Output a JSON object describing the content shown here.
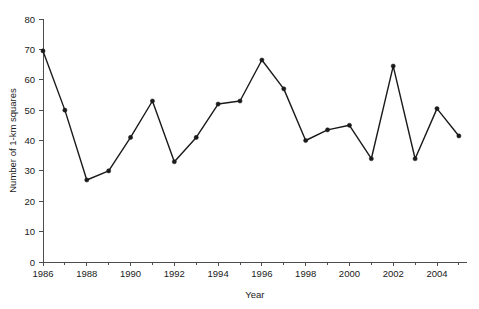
{
  "chart_data": {
    "type": "line",
    "title": "",
    "xlabel": "Year",
    "ylabel": "Number of 1-km squares",
    "x": [
      1986,
      1987,
      1988,
      1989,
      1990,
      1991,
      1992,
      1993,
      1994,
      1995,
      1996,
      1997,
      1998,
      1999,
      2000,
      2001,
      2002,
      2003,
      2004,
      2005
    ],
    "values": [
      69.5,
      50,
      27,
      30,
      41,
      53,
      33,
      41,
      52,
      53,
      66.5,
      57,
      40,
      43.5,
      45,
      34,
      64.5,
      34,
      50.5,
      41.5
    ],
    "series": [
      {
        "name": "Number of 1-km squares",
        "values": [
          69.5,
          50,
          27,
          30,
          41,
          53,
          33,
          41,
          52,
          53,
          66.5,
          57,
          40,
          43.5,
          45,
          34,
          64.5,
          34,
          50.5,
          41.5
        ]
      }
    ],
    "xlim": [
      1986,
      2005
    ],
    "ylim": [
      0,
      80
    ],
    "x_tick_labels": [
      "1986",
      "1988",
      "1990",
      "1992",
      "1994",
      "1996",
      "1998",
      "2000",
      "2002",
      "2004"
    ],
    "x_tick_values": [
      1986,
      1988,
      1990,
      1992,
      1994,
      1996,
      1998,
      2000,
      2002,
      2004
    ],
    "x_minor_tick_values": [
      1987,
      1989,
      1991,
      1993,
      1995,
      1997,
      1999,
      2001,
      2003,
      2005
    ],
    "y_tick_labels": [
      "0",
      "10",
      "20",
      "30",
      "40",
      "50",
      "60",
      "70",
      "80"
    ],
    "y_tick_values": [
      0,
      10,
      20,
      30,
      40,
      50,
      60,
      70,
      80
    ],
    "grid": false,
    "legend": false,
    "legend_position": "none",
    "marker": "filled-circle",
    "line_color": "#1a1a1a",
    "marker_color": "#1a1a1a",
    "axis_color": "#4d4d4d",
    "background_color": "#ffffff"
  }
}
